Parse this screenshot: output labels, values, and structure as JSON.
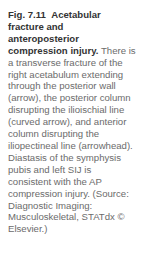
{
  "figure": {
    "label": "Fig. 7.11",
    "title": "Acetabular fracture and anteroposterior compression injury.",
    "body": "There is a transverse fracture of the right acetabulum extending through the posterior wall (arrow), the posterior column disrupting the ilioischial line (curved arrow), and anterior column disrupting the iliopectineal line (arrowhead). Diastasis of the symphysis pubis and left SIJ is consistent with the AP compression injury. (Source: Diagnostic Imaging: Musculoskeletal, STATdx © Elsevier.)"
  }
}
